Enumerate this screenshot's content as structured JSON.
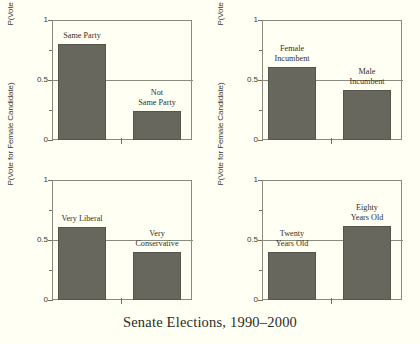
{
  "caption": "Senate Elections, 1990–2000",
  "axis": {
    "ylabel": "P(Vote for Female Candidate)",
    "ytick_labels": [
      "0",
      "0.5",
      "1"
    ]
  },
  "chart_data": {
    "type": "bar",
    "title": "Senate Elections, 1990–2000",
    "xlabel": "",
    "ylabel": "P(Vote for Female Candidate)",
    "ylim": [
      0,
      1
    ],
    "yticks": [
      0,
      0.5,
      1
    ],
    "yticks_minor": [
      0.25,
      0.75
    ],
    "grid": "horizontal line at 0.5 only",
    "legend": "none",
    "panels": [
      {
        "index": 0,
        "position": "top-left",
        "ylabel": "P(Vote for Female Candidate)",
        "categories": [
          "Same Party",
          "Not\nSame Party"
        ],
        "values": [
          0.8,
          0.24
        ]
      },
      {
        "index": 1,
        "position": "top-right",
        "ylabel": "P(Vote for Female Candidate)",
        "categories": [
          "Female\nIncumbent",
          "Male\nIncumbent"
        ],
        "values": [
          0.61,
          0.42
        ]
      },
      {
        "index": 2,
        "position": "bottom-left",
        "ylabel": "P(Vote for Female Candidate)",
        "categories": [
          "Very Liberal",
          "Very\nConservative"
        ],
        "values": [
          0.61,
          0.4
        ]
      },
      {
        "index": 3,
        "position": "bottom-right",
        "ylabel": "P(Vote for Female Candidate)",
        "categories": [
          "Twenty\nYears Old",
          "Eighty\nYears Old"
        ],
        "values": [
          0.4,
          0.62
        ]
      }
    ],
    "colors": {
      "bar_fill": "#67675e",
      "bar_edge": "#55554d",
      "background": "#fffff4",
      "axis": "#8a8a7d"
    }
  }
}
